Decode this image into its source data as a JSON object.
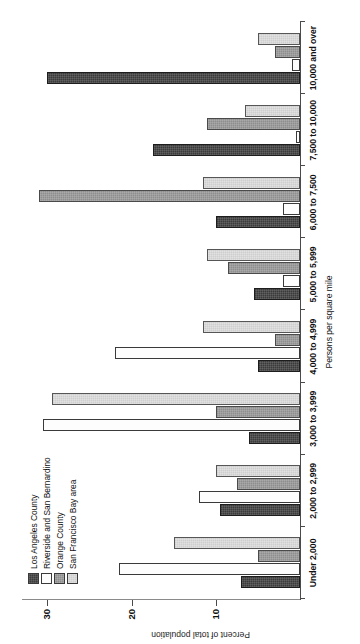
{
  "chart_data": {
    "type": "bar",
    "title": "",
    "xlabel": "Persons per square mile",
    "ylabel": "Percent of total population",
    "ylim": [
      0,
      33
    ],
    "yticks": [
      10,
      20,
      30
    ],
    "grid": false,
    "legend_position": "upper-left",
    "categories": [
      "Under 2,000",
      "2,000 to 2,999",
      "3,000 to 3,999",
      "4,000 to 4,999",
      "5,000 to 5,999",
      "6,000 to 7,500",
      "7,500 to 10,000",
      "10,000 and over"
    ],
    "series": [
      {
        "name": "Los Angeles County",
        "swatch": "#3b3b3b",
        "values": [
          7.0,
          9.5,
          6.0,
          5.0,
          5.5,
          10.0,
          17.5,
          30.0
        ]
      },
      {
        "name": "Riverside and San Bernardino",
        "swatch": "#fdfdfd",
        "values": [
          21.5,
          12.0,
          30.5,
          22.0,
          2.0,
          2.0,
          0.5,
          1.0
        ]
      },
      {
        "name": "Orange County",
        "swatch": "#8e8e8e",
        "values": [
          5.0,
          7.5,
          10.0,
          3.0,
          8.5,
          31.0,
          11.0,
          3.0
        ]
      },
      {
        "name": "San Francisco Bay area",
        "swatch": "#cfcfcf",
        "values": [
          15.0,
          10.0,
          29.5,
          11.5,
          11.0,
          11.5,
          6.5,
          5.0
        ]
      }
    ]
  },
  "axis": {
    "y_title": "Percent of total population",
    "x_title": "Persons per square mile",
    "y_tick_labels": [
      "30",
      "20",
      "10"
    ]
  },
  "legend": {
    "items": [
      {
        "label": "Los Angeles County"
      },
      {
        "label": "Riverside and San Bernardino"
      },
      {
        "label": "Orange County"
      },
      {
        "label": "San Francisco Bay area"
      }
    ]
  }
}
